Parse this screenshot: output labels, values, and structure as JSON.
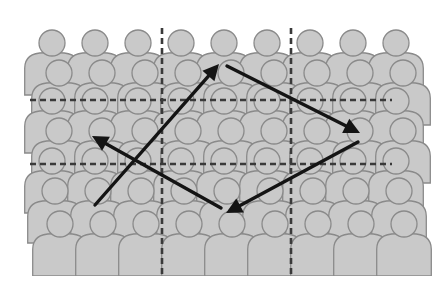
{
  "diagram": {
    "colors": {
      "background": "#ffffff",
      "person_fill": "#c9c9c9",
      "person_stroke": "#8a8a8a",
      "grid_line": "#3a3a3a",
      "arrow": "#141414"
    },
    "crowd": {
      "columns": 9,
      "rows": 5,
      "column_spacing": 43,
      "rows_spec": [
        {
          "head_y": 43,
          "x_start": 52
        },
        {
          "head_y": 73,
          "x_start": 59
        },
        {
          "head_y": 101,
          "x_start": 52
        },
        {
          "head_y": 131,
          "x_start": 59
        },
        {
          "head_y": 161,
          "x_start": 52
        },
        {
          "head_y": 191,
          "x_start": 55
        },
        {
          "head_y": 224,
          "x_start": 60
        }
      ],
      "head_radius": 13
    },
    "grid_lines": {
      "vertical": [
        {
          "x": 162,
          "y1": 28,
          "y2": 274
        },
        {
          "x": 291,
          "y1": 28,
          "y2": 274
        }
      ],
      "horizontal": [
        {
          "y": 100,
          "x1": 30,
          "x2": 392
        },
        {
          "y": 164,
          "x1": 30,
          "x2": 392
        }
      ],
      "dash": "6 4"
    },
    "arrows": [
      {
        "name": "arrow-up-right",
        "from": [
          95,
          205
        ],
        "to": [
          219,
          64
        ]
      },
      {
        "name": "arrow-down-right",
        "from": [
          227,
          66
        ],
        "to": [
          360,
          133
        ]
      },
      {
        "name": "arrow-down-left",
        "from": [
          358,
          142
        ],
        "to": [
          226,
          213
        ]
      },
      {
        "name": "arrow-up-left",
        "from": [
          221,
          208
        ],
        "to": [
          92,
          136
        ]
      }
    ]
  }
}
